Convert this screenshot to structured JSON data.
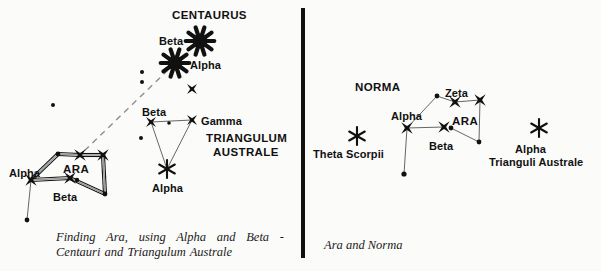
{
  "figure": {
    "type": "star-chart",
    "background_color": "#fbfbf9",
    "ink_color": "#111111",
    "divider": {
      "x": 303,
      "y1": 8,
      "y2": 258,
      "width": 4,
      "color": "#111111"
    }
  },
  "left_panel": {
    "caption_line1": "Finding Ara, using Alpha and Beta -",
    "caption_line2": "Centauri and Triangulum Australe",
    "constellation_titles": [
      {
        "name": "constellation-title-centaurus",
        "text": "CENTAURUS",
        "x": 172,
        "y": 9
      },
      {
        "name": "constellation-title-triangulum",
        "text": "TRIANGULUM",
        "x": 206,
        "y": 132
      },
      {
        "name": "constellation-title-australe",
        "text": "AUSTRALE",
        "x": 213,
        "y": 146
      },
      {
        "name": "constellation-title-ara",
        "text": "ARA",
        "x": 63,
        "y": 163
      }
    ],
    "star_labels": [
      {
        "name": "label-beta-centauri",
        "text": "Beta",
        "x": 159,
        "y": 35
      },
      {
        "name": "label-alpha-centauri",
        "text": "Alpha",
        "x": 190,
        "y": 59
      },
      {
        "name": "label-beta-trianguli",
        "text": "Beta",
        "x": 142,
        "y": 106
      },
      {
        "name": "label-gamma-trianguli",
        "text": "Gamma",
        "x": 201,
        "y": 115
      },
      {
        "name": "label-alpha-trianguli",
        "text": "Alpha",
        "x": 152,
        "y": 182
      },
      {
        "name": "label-alpha-arae",
        "text": "Alpha",
        "x": 9,
        "y": 167
      },
      {
        "name": "label-beta-arae",
        "text": "Beta",
        "x": 53,
        "y": 191
      }
    ],
    "stars": [
      {
        "name": "star-beta-centauri",
        "label": "Beta",
        "marker": "burst",
        "x": 200,
        "y": 41,
        "size": 14
      },
      {
        "name": "star-alpha-centauri",
        "label": "Alpha",
        "marker": "burst",
        "x": 175,
        "y": 63,
        "size": 14
      },
      {
        "name": "star-centaurus-minor",
        "label": "",
        "marker": "cross",
        "x": 192,
        "y": 89,
        "size": 7
      },
      {
        "name": "star-beta-trianguli",
        "label": "Beta",
        "marker": "cross",
        "x": 151,
        "y": 122,
        "size": 7
      },
      {
        "name": "star-gamma-trianguli",
        "label": "Gamma",
        "marker": "cross",
        "x": 192,
        "y": 120,
        "size": 7
      },
      {
        "name": "star-alpha-trianguli",
        "label": "Alpha",
        "marker": "asterisk",
        "x": 167,
        "y": 169,
        "size": 9
      },
      {
        "name": "star-alpha-arae",
        "label": "Alpha",
        "marker": "cross",
        "x": 31,
        "y": 180,
        "size": 8
      },
      {
        "name": "star-beta-arae",
        "label": "Beta",
        "marker": "cross",
        "x": 70,
        "y": 178,
        "size": 8
      },
      {
        "name": "star-ara-left",
        "label": "",
        "marker": "cross",
        "x": 80,
        "y": 155,
        "size": 8
      },
      {
        "name": "star-ara-right",
        "label": "",
        "marker": "cross",
        "x": 103,
        "y": 155,
        "size": 8
      }
    ],
    "faint_dots": [
      {
        "name": "faint-dot-1",
        "x": 142,
        "y": 72,
        "r": 2.0
      },
      {
        "name": "faint-dot-2",
        "x": 142,
        "y": 82,
        "r": 2.0
      },
      {
        "name": "faint-dot-3",
        "x": 53,
        "y": 105,
        "r": 2.0
      },
      {
        "name": "faint-dot-4",
        "x": 169,
        "y": 123,
        "r": 1.8
      },
      {
        "name": "faint-dot-5",
        "x": 141,
        "y": 138,
        "r": 2.0
      },
      {
        "name": "faint-dot-6",
        "x": 58,
        "y": 154,
        "r": 2.4
      },
      {
        "name": "faint-dot-7",
        "x": 77,
        "y": 180,
        "r": 2.2
      },
      {
        "name": "faint-dot-8",
        "x": 105,
        "y": 194,
        "r": 2.4
      },
      {
        "name": "faint-dot-9",
        "x": 27,
        "y": 220,
        "r": 2.4
      }
    ],
    "constellation_lines": [
      {
        "name": "ara-line-alpha-top",
        "x1": 31,
        "y1": 180,
        "x2": 58,
        "y2": 154,
        "style": "double"
      },
      {
        "name": "ara-line-top-left",
        "x1": 58,
        "y1": 154,
        "x2": 80,
        "y2": 155,
        "style": "double"
      },
      {
        "name": "ara-line-top-right",
        "x1": 80,
        "y1": 155,
        "x2": 103,
        "y2": 155,
        "style": "double"
      },
      {
        "name": "ara-line-right-down",
        "x1": 103,
        "y1": 155,
        "x2": 105,
        "y2": 194,
        "style": "double"
      },
      {
        "name": "ara-line-bottom",
        "x1": 105,
        "y1": 194,
        "x2": 70,
        "y2": 178,
        "style": "double"
      },
      {
        "name": "ara-line-beta-alpha",
        "x1": 70,
        "y1": 178,
        "x2": 31,
        "y2": 180,
        "style": "double"
      },
      {
        "name": "ara-line-alpha-tail",
        "x1": 31,
        "y1": 180,
        "x2": 27,
        "y2": 220,
        "style": "thin"
      },
      {
        "name": "tra-line-beta-gamma",
        "x1": 151,
        "y1": 122,
        "x2": 192,
        "y2": 120,
        "style": "thin"
      },
      {
        "name": "tra-line-beta-alpha",
        "x1": 151,
        "y1": 122,
        "x2": 167,
        "y2": 169,
        "style": "thin"
      },
      {
        "name": "tra-line-gamma-alpha",
        "x1": 192,
        "y1": 120,
        "x2": 167,
        "y2": 169,
        "style": "thin"
      }
    ],
    "pointer_line": {
      "name": "pointer-line-centauri-to-ara",
      "x1": 168,
      "y1": 70,
      "x2": 80,
      "y2": 155,
      "style": "dashed",
      "meaning": "Alpha and Beta Centauri point toward Ara"
    }
  },
  "right_panel": {
    "caption_line1": "Ara and Norma",
    "constellation_titles": [
      {
        "name": "constellation-title-norma",
        "text": "NORMA",
        "x": 355,
        "y": 81
      },
      {
        "name": "constellation-title-ara",
        "text": "ARA",
        "x": 452,
        "y": 115
      }
    ],
    "star_labels": [
      {
        "name": "label-zeta-arae",
        "text": "Zeta",
        "x": 445,
        "y": 87
      },
      {
        "name": "label-alpha-arae",
        "text": "Alpha",
        "x": 391,
        "y": 110
      },
      {
        "name": "label-beta-arae",
        "text": "Beta",
        "x": 429,
        "y": 140
      },
      {
        "name": "label-theta-scorpii",
        "text": "Theta Scorpii",
        "x": 313,
        "y": 148
      },
      {
        "name": "label-alpha-trianguli",
        "text": "Alpha",
        "x": 515,
        "y": 143
      },
      {
        "name": "label-trianguli-australe",
        "text": "Trianguli Australe",
        "x": 489,
        "y": 156
      }
    ],
    "stars": [
      {
        "name": "star-theta-scorpii",
        "label": "Theta Scorpii",
        "marker": "asterisk",
        "x": 357,
        "y": 136,
        "size": 9
      },
      {
        "name": "star-alpha-arae",
        "label": "Alpha",
        "marker": "cross",
        "x": 407,
        "y": 128,
        "size": 8
      },
      {
        "name": "star-beta-arae",
        "label": "Beta",
        "marker": "cross",
        "x": 444,
        "y": 127,
        "size": 8
      },
      {
        "name": "star-zeta-arae",
        "label": "Zeta",
        "marker": "cross",
        "x": 455,
        "y": 102,
        "size": 8
      },
      {
        "name": "star-ara-upper-right",
        "label": "",
        "marker": "cross",
        "x": 480,
        "y": 100,
        "size": 8
      },
      {
        "name": "star-alpha-trianguli",
        "label": "Alpha",
        "marker": "asterisk",
        "x": 539,
        "y": 128,
        "size": 9
      }
    ],
    "faint_dots": [
      {
        "name": "faint-dot-1",
        "x": 437,
        "y": 96,
        "r": 2.4
      },
      {
        "name": "faint-dot-2",
        "x": 451,
        "y": 128,
        "r": 2.4
      },
      {
        "name": "faint-dot-3",
        "x": 479,
        "y": 142,
        "r": 2.4
      },
      {
        "name": "faint-dot-4",
        "x": 404,
        "y": 174,
        "r": 2.6
      }
    ],
    "constellation_lines": [
      {
        "name": "ara-line-alpha-dot",
        "x1": 407,
        "y1": 128,
        "x2": 437,
        "y2": 96,
        "style": "thin"
      },
      {
        "name": "ara-line-dot-zeta",
        "x1": 437,
        "y1": 96,
        "x2": 455,
        "y2": 102,
        "style": "thin"
      },
      {
        "name": "ara-line-zeta-upper",
        "x1": 455,
        "y1": 102,
        "x2": 480,
        "y2": 100,
        "style": "thin"
      },
      {
        "name": "ara-line-upper-down",
        "x1": 480,
        "y1": 100,
        "x2": 479,
        "y2": 142,
        "style": "thin"
      },
      {
        "name": "ara-line-down-beta",
        "x1": 479,
        "y1": 142,
        "x2": 451,
        "y2": 128,
        "style": "thin"
      },
      {
        "name": "ara-line-beta-alpha",
        "x1": 444,
        "y1": 127,
        "x2": 407,
        "y2": 128,
        "style": "thin"
      },
      {
        "name": "ara-line-alpha-tail",
        "x1": 407,
        "y1": 128,
        "x2": 404,
        "y2": 174,
        "style": "thin"
      }
    ]
  }
}
